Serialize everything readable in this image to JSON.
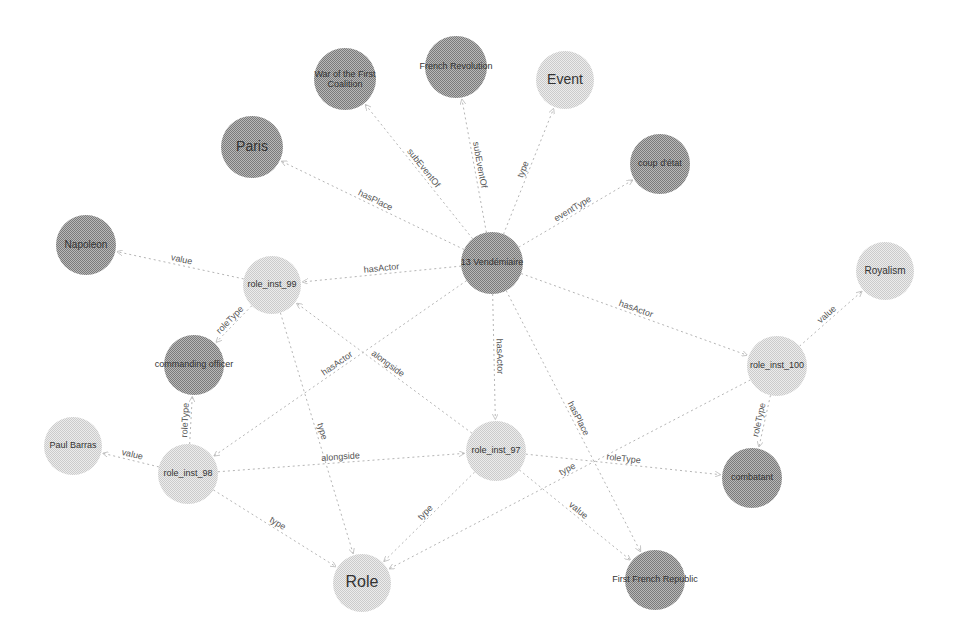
{
  "colors": {
    "dark_node": "#9a9a9a",
    "light_node": "#dcdcdc",
    "edge": "#b5b5b5",
    "background": "#ffffff"
  },
  "nodes": [
    {
      "id": "center",
      "label": "13 Vendémiaire",
      "x": 492,
      "y": 263,
      "r": 31,
      "shade": "dark",
      "size": 9
    },
    {
      "id": "war",
      "label": "War of the First Coalition",
      "x": 345,
      "y": 79,
      "r": 31,
      "shade": "dark",
      "size": 9
    },
    {
      "id": "frrev",
      "label": "French Revolution",
      "x": 456,
      "y": 67,
      "r": 31,
      "shade": "dark",
      "size": 9
    },
    {
      "id": "event",
      "label": "Event",
      "x": 565,
      "y": 80,
      "r": 29,
      "shade": "light",
      "size": 14
    },
    {
      "id": "paris",
      "label": "Paris",
      "x": 252,
      "y": 147,
      "r": 31,
      "shade": "dark",
      "size": 14
    },
    {
      "id": "coup",
      "label": "coup d'état",
      "x": 660,
      "y": 164,
      "r": 30,
      "shade": "dark",
      "size": 9
    },
    {
      "id": "napoleon",
      "label": "Napoleon",
      "x": 86,
      "y": 245,
      "r": 30,
      "shade": "dark",
      "size": 10
    },
    {
      "id": "ri99",
      "label": "role_inst_99",
      "x": 272,
      "y": 285,
      "r": 29,
      "shade": "light",
      "size": 9
    },
    {
      "id": "royalism",
      "label": "Royalism",
      "x": 885,
      "y": 271,
      "r": 29,
      "shade": "light",
      "size": 10
    },
    {
      "id": "cmdoff",
      "label": "commanding officer",
      "x": 194,
      "y": 365,
      "r": 30,
      "shade": "dark",
      "size": 9
    },
    {
      "id": "ri100",
      "label": "role_inst_100",
      "x": 777,
      "y": 366,
      "r": 30,
      "shade": "light",
      "size": 9
    },
    {
      "id": "barras",
      "label": "Paul Barras",
      "x": 73,
      "y": 446,
      "r": 29,
      "shade": "light",
      "size": 9
    },
    {
      "id": "ri98",
      "label": "role_inst_98",
      "x": 188,
      "y": 474,
      "r": 30,
      "shade": "light",
      "size": 9
    },
    {
      "id": "ri97",
      "label": "role_inst_97",
      "x": 496,
      "y": 451,
      "r": 30,
      "shade": "light",
      "size": 9
    },
    {
      "id": "combatant",
      "label": "combatant",
      "x": 752,
      "y": 478,
      "r": 30,
      "shade": "dark",
      "size": 9
    },
    {
      "id": "role",
      "label": "Role",
      "x": 362,
      "y": 583,
      "r": 29,
      "shade": "light",
      "size": 16
    },
    {
      "id": "ffr",
      "label": "First French Republic",
      "x": 655,
      "y": 580,
      "r": 30,
      "shade": "dark",
      "size": 9
    }
  ],
  "edges": [
    {
      "from": "center",
      "to": "war",
      "label": "subEventOf"
    },
    {
      "from": "center",
      "to": "frrev",
      "label": "subEventOf"
    },
    {
      "from": "center",
      "to": "event",
      "label": "type"
    },
    {
      "from": "center",
      "to": "coup",
      "label": "eventType"
    },
    {
      "from": "center",
      "to": "paris",
      "label": "hasPlace"
    },
    {
      "from": "center",
      "to": "ri99",
      "label": "hasActor"
    },
    {
      "from": "center",
      "to": "ri100",
      "label": "hasActor"
    },
    {
      "from": "center",
      "to": "ri97",
      "label": "hasActor"
    },
    {
      "from": "center",
      "to": "ri98",
      "label": "hasActor"
    },
    {
      "from": "center",
      "to": "ffr",
      "label": "hasPlace"
    },
    {
      "from": "ri99",
      "to": "napoleon",
      "label": "value"
    },
    {
      "from": "ri99",
      "to": "cmdoff",
      "label": "roleType"
    },
    {
      "from": "ri99",
      "to": "role",
      "label": "type"
    },
    {
      "from": "ri97",
      "to": "ri99",
      "label": "alongside"
    },
    {
      "from": "ri98",
      "to": "barras",
      "label": "value"
    },
    {
      "from": "ri98",
      "to": "cmdoff",
      "label": "roleType"
    },
    {
      "from": "ri98",
      "to": "role",
      "label": "type"
    },
    {
      "from": "ri98",
      "to": "ri97",
      "label": "alongside"
    },
    {
      "from": "ri97",
      "to": "role",
      "label": "type"
    },
    {
      "from": "ri97",
      "to": "combatant",
      "label": "roleType"
    },
    {
      "from": "ri97",
      "to": "ffr",
      "label": "value"
    },
    {
      "from": "ri100",
      "to": "royalism",
      "label": "value"
    },
    {
      "from": "ri100",
      "to": "combatant",
      "label": "roleType"
    },
    {
      "from": "ri100",
      "to": "role",
      "label": "type"
    }
  ]
}
